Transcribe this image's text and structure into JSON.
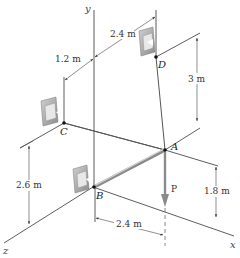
{
  "figure": {
    "axes": {
      "x": "x",
      "y": "y",
      "z": "z"
    },
    "points": {
      "A": "A",
      "B": "B",
      "C": "C",
      "D": "D"
    },
    "load": {
      "label": "P"
    },
    "dimensions": {
      "d_top_offset": "2.4 m",
      "c_offset": "1.2 m",
      "d_height": "3 m",
      "c_height": "2.6 m",
      "a_height": "1.8 m",
      "a_offset_x": "2.4 m"
    },
    "colors": {
      "line": "#333333",
      "bracket": "#9a9a9a",
      "load_arrow": "#8a8a8a",
      "background": "#ffffff"
    }
  }
}
